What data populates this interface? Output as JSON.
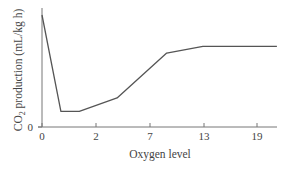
{
  "chart_data": {
    "type": "line",
    "title": "",
    "xlabel": "Oxygen level",
    "ylabel": "CO2 production (mL/kg h)",
    "ylabel_main": "CO",
    "ylabel_sub": "2",
    "ylabel_rest": " production (mL/kg h)",
    "x_ticks": [
      "0",
      "2",
      "7",
      "13",
      "19"
    ],
    "y_ticks": [
      "0"
    ],
    "x_tick_positions_px": [
      42,
      96,
      150,
      204,
      257
    ],
    "grid": false,
    "legend": null,
    "series": [
      {
        "name": "CO2 production",
        "color": "#555555",
        "points_tick_index": [
          {
            "x": 0.0,
            "y": 1.0
          },
          {
            "x": 0.35,
            "y": 0.14
          },
          {
            "x": 0.69,
            "y": 0.14
          },
          {
            "x": 1.39,
            "y": 0.26
          },
          {
            "x": 2.31,
            "y": 0.66
          },
          {
            "x": 2.98,
            "y": 0.72
          },
          {
            "x": 4.35,
            "y": 0.72
          }
        ],
        "x_approx_oxygen_level": [
          0,
          0.7,
          1.4,
          4.0,
          10.5,
          13,
          21
        ],
        "y_relative": [
          1.0,
          0.14,
          0.14,
          0.26,
          0.66,
          0.72,
          0.72
        ]
      }
    ],
    "note": "Y axis is unscaled except for the 0 mark; values given as fraction of the peak."
  }
}
